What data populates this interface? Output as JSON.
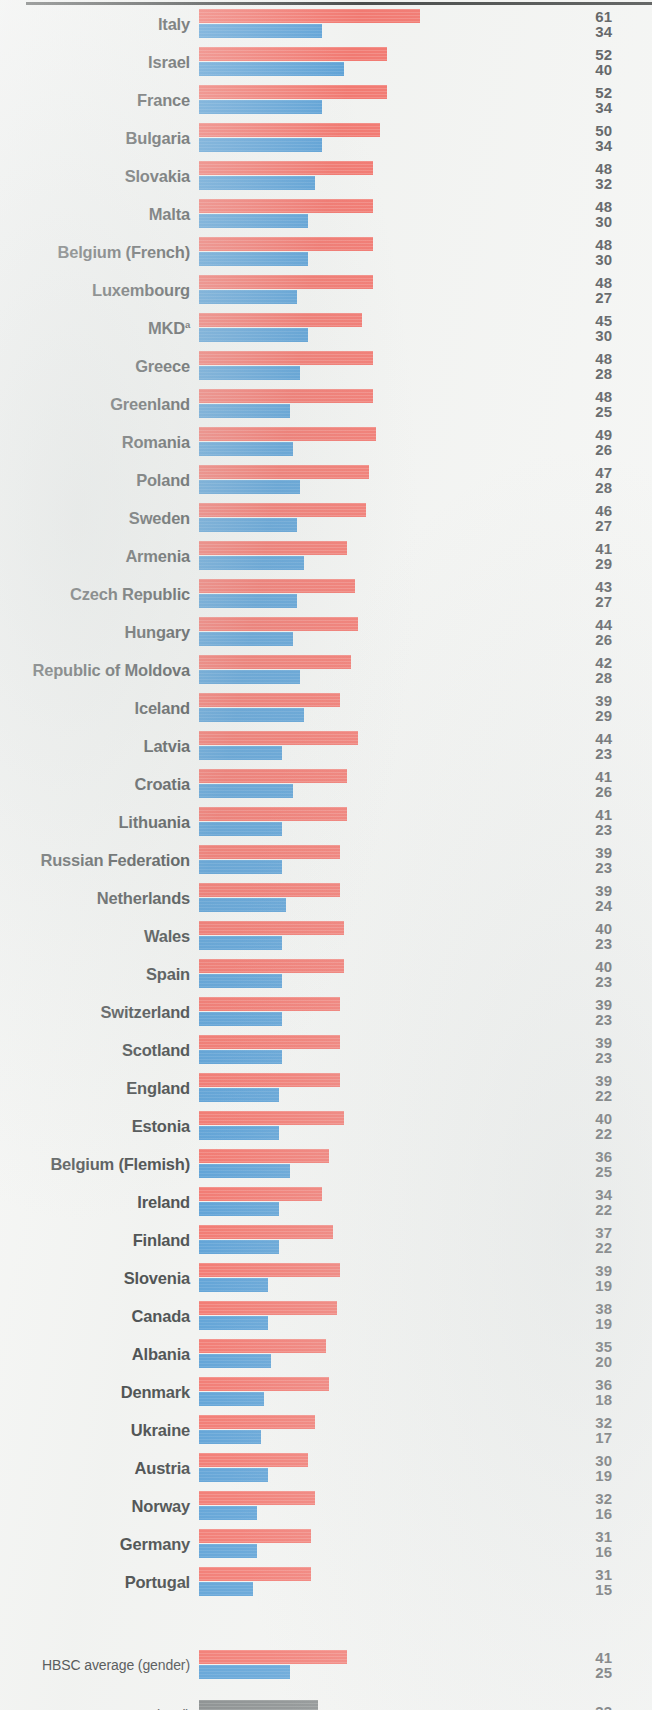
{
  "chart_data": {
    "type": "bar",
    "orientation": "horizontal",
    "title": "",
    "xlabel": "",
    "ylabel": "",
    "xlim": [
      0,
      65
    ],
    "grid": false,
    "legend": [],
    "series": [
      {
        "name": "boys",
        "color": "#f2655c"
      },
      {
        "name": "girls",
        "color": "#4795d2"
      },
      {
        "name": "total",
        "color": "#767b7c"
      }
    ],
    "value_scale_px_per_unit": 3.62,
    "categories": [
      "Italy",
      "Israel",
      "France",
      "Bulgaria",
      "Slovakia",
      "Malta",
      "Belgium (French)",
      "Luxembourg",
      "MKD",
      "Greece",
      "Greenland",
      "Romania",
      "Poland",
      "Sweden",
      "Armenia",
      "Czech Republic",
      "Hungary",
      "Republic of Moldova",
      "Iceland",
      "Latvia",
      "Croatia",
      "Lithuania",
      "Russian Federation",
      "Netherlands",
      "Wales",
      "Spain",
      "Switzerland",
      "Scotland",
      "England",
      "Estonia",
      "Belgium (Flemish)",
      "Ireland",
      "Finland",
      "Slovenia",
      "Canada",
      "Albania",
      "Denmark",
      "Ukraine",
      "Austria",
      "Norway",
      "Germany",
      "Portugal"
    ],
    "boys": [
      61,
      52,
      52,
      50,
      48,
      48,
      48,
      48,
      45,
      48,
      48,
      49,
      47,
      46,
      41,
      43,
      44,
      42,
      39,
      44,
      41,
      41,
      39,
      39,
      40,
      40,
      39,
      39,
      39,
      40,
      36,
      34,
      37,
      39,
      38,
      35,
      36,
      32,
      30,
      32,
      31,
      31
    ],
    "girls": [
      34,
      40,
      34,
      34,
      32,
      30,
      30,
      27,
      30,
      28,
      25,
      26,
      28,
      27,
      29,
      27,
      26,
      28,
      29,
      23,
      26,
      23,
      23,
      24,
      23,
      23,
      23,
      23,
      22,
      22,
      25,
      22,
      22,
      19,
      19,
      20,
      18,
      17,
      19,
      16,
      16,
      15
    ]
  },
  "rows": [
    {
      "label": "Italy",
      "sup": "",
      "boys": 61,
      "girls": 34
    },
    {
      "label": "Israel",
      "sup": "",
      "boys": 52,
      "girls": 40
    },
    {
      "label": "France",
      "sup": "",
      "boys": 52,
      "girls": 34
    },
    {
      "label": "Bulgaria",
      "sup": "",
      "boys": 50,
      "girls": 34
    },
    {
      "label": "Slovakia",
      "sup": "",
      "boys": 48,
      "girls": 32
    },
    {
      "label": "Malta",
      "sup": "",
      "boys": 48,
      "girls": 30
    },
    {
      "label": "Belgium (French)",
      "sup": "",
      "boys": 48,
      "girls": 30
    },
    {
      "label": "Luxembourg",
      "sup": "",
      "boys": 48,
      "girls": 27
    },
    {
      "label": "MKD",
      "sup": "a",
      "boys": 45,
      "girls": 30
    },
    {
      "label": "Greece",
      "sup": "",
      "boys": 48,
      "girls": 28
    },
    {
      "label": "Greenland",
      "sup": "",
      "boys": 48,
      "girls": 25
    },
    {
      "label": "Romania",
      "sup": "",
      "boys": 49,
      "girls": 26
    },
    {
      "label": "Poland",
      "sup": "",
      "boys": 47,
      "girls": 28
    },
    {
      "label": "Sweden",
      "sup": "",
      "boys": 46,
      "girls": 27
    },
    {
      "label": "Armenia",
      "sup": "",
      "boys": 41,
      "girls": 29
    },
    {
      "label": "Czech Republic",
      "sup": "",
      "boys": 43,
      "girls": 27
    },
    {
      "label": "Hungary",
      "sup": "",
      "boys": 44,
      "girls": 26
    },
    {
      "label": "Republic of Moldova",
      "sup": "",
      "boys": 42,
      "girls": 28
    },
    {
      "label": "Iceland",
      "sup": "",
      "boys": 39,
      "girls": 29
    },
    {
      "label": "Latvia",
      "sup": "",
      "boys": 44,
      "girls": 23
    },
    {
      "label": "Croatia",
      "sup": "",
      "boys": 41,
      "girls": 26
    },
    {
      "label": "Lithuania",
      "sup": "",
      "boys": 41,
      "girls": 23
    },
    {
      "label": "Russian Federation",
      "sup": "",
      "boys": 39,
      "girls": 23
    },
    {
      "label": "Netherlands",
      "sup": "",
      "boys": 39,
      "girls": 24
    },
    {
      "label": "Wales",
      "sup": "",
      "boys": 40,
      "girls": 23
    },
    {
      "label": "Spain",
      "sup": "",
      "boys": 40,
      "girls": 23
    },
    {
      "label": "Switzerland",
      "sup": "",
      "boys": 39,
      "girls": 23
    },
    {
      "label": "Scotland",
      "sup": "",
      "boys": 39,
      "girls": 23
    },
    {
      "label": "England",
      "sup": "",
      "boys": 39,
      "girls": 22
    },
    {
      "label": "Estonia",
      "sup": "",
      "boys": 40,
      "girls": 22
    },
    {
      "label": "Belgium (Flemish)",
      "sup": "",
      "boys": 36,
      "girls": 25
    },
    {
      "label": "Ireland",
      "sup": "",
      "boys": 34,
      "girls": 22
    },
    {
      "label": "Finland",
      "sup": "",
      "boys": 37,
      "girls": 22
    },
    {
      "label": "Slovenia",
      "sup": "",
      "boys": 39,
      "girls": 19
    },
    {
      "label": "Canada",
      "sup": "",
      "boys": 38,
      "girls": 19
    },
    {
      "label": "Albania",
      "sup": "",
      "boys": 35,
      "girls": 20
    },
    {
      "label": "Denmark",
      "sup": "",
      "boys": 36,
      "girls": 18
    },
    {
      "label": "Ukraine",
      "sup": "",
      "boys": 32,
      "girls": 17
    },
    {
      "label": "Austria",
      "sup": "",
      "boys": 30,
      "girls": 19
    },
    {
      "label": "Norway",
      "sup": "",
      "boys": 32,
      "girls": 16
    },
    {
      "label": "Germany",
      "sup": "",
      "boys": 31,
      "girls": 16
    },
    {
      "label": "Portugal",
      "sup": "",
      "boys": 31,
      "girls": 15
    }
  ],
  "averages": [
    {
      "label": "HBSC average (gender)",
      "boys": 41,
      "girls": 25
    },
    {
      "label": "HBSC average (total)",
      "total": 33
    }
  ]
}
